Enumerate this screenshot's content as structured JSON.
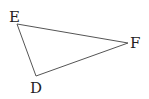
{
  "diagram": {
    "type": "triangle",
    "vertices": [
      {
        "id": "E",
        "label": "E",
        "x": 17,
        "y": 24,
        "label_x": 9,
        "label_y": 22
      },
      {
        "id": "F",
        "label": "F",
        "x": 128,
        "y": 43,
        "label_x": 130,
        "label_y": 48
      },
      {
        "id": "D",
        "label": "D",
        "x": 36,
        "y": 76,
        "label_x": 30,
        "label_y": 93
      }
    ],
    "edges": [
      [
        "E",
        "F"
      ],
      [
        "F",
        "D"
      ],
      [
        "D",
        "E"
      ]
    ],
    "stroke_color": "#555555"
  }
}
